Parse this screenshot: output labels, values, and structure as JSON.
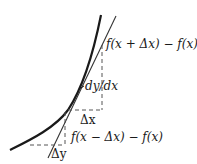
{
  "diagram": {
    "type": "derivative-approximation",
    "labels": {
      "forward_difference": "f(x + Δx) − f(x)",
      "derivative": "dy/dx",
      "delta_x": "Δx",
      "backward_difference": "f(x − Δx) − f(x)",
      "delta_y": "Δy"
    },
    "colors": {
      "curve": "#1a1a1a",
      "tangent": "#333333",
      "dashed": "#555555",
      "background": "#ffffff"
    }
  }
}
